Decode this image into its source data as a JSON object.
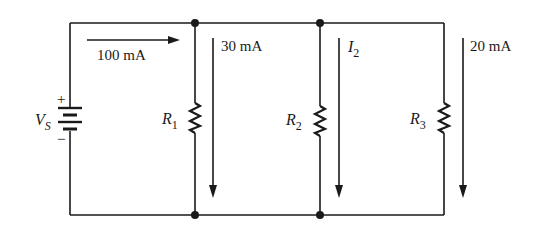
{
  "diagram": {
    "type": "parallel-circuit",
    "source": {
      "label": "V",
      "subscript": "S",
      "plus": "+",
      "minus": "−"
    },
    "total_current": "100 mA",
    "branches": [
      {
        "resistor": "R",
        "subscript": "1",
        "current": "30 mA"
      },
      {
        "resistor": "R",
        "subscript": "2",
        "current_label": "I",
        "current_subscript": "2"
      },
      {
        "resistor": "R",
        "subscript": "3",
        "current": "20 mA"
      }
    ]
  }
}
